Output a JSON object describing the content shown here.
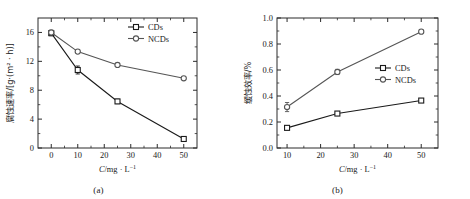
{
  "figure": {
    "background_color": "#ffffff",
    "panel_count": 2
  },
  "chart_data": [
    {
      "type": "line",
      "panel_label": "(a)",
      "title": "",
      "xlabel": "C/mg · L⁻¹",
      "ylabel": "腐蚀速率/[g·(m² · h)]",
      "xlim": [
        -5,
        55
      ],
      "ylim": [
        0,
        18
      ],
      "xticks": [
        0,
        10,
        20,
        30,
        40,
        50
      ],
      "xtick_labels": [
        "0",
        "10",
        "20",
        "30",
        "40",
        "50"
      ],
      "yticks": [
        0,
        4,
        8,
        12,
        16
      ],
      "ytick_labels": [
        "0",
        "4",
        "8",
        "12",
        "16"
      ],
      "minor_x_ticks": [
        5,
        15,
        25,
        35,
        45
      ],
      "minor_y_ticks": [
        2,
        6,
        10,
        14
      ],
      "grid": false,
      "legend_position": "top-right",
      "x": [
        0,
        10,
        25,
        50
      ],
      "series": [
        {
          "name": "CDs",
          "color": "#1a1a1a",
          "marker": "square-open",
          "values": [
            15.9,
            10.8,
            6.45,
            1.25
          ],
          "errors": [
            0.35,
            0.55,
            0.3,
            0.2
          ]
        },
        {
          "name": "NCDs",
          "color": "#555555",
          "marker": "circle-open",
          "values": [
            16.0,
            13.35,
            11.5,
            9.65
          ],
          "errors": [
            0.3,
            0.2,
            0.2,
            0.2
          ]
        }
      ]
    },
    {
      "type": "line",
      "panel_label": "(b)",
      "title": "",
      "xlabel": "C/mg · L⁻¹",
      "ylabel": "缓蚀效率/%",
      "xlim": [
        7,
        55
      ],
      "ylim": [
        0.0,
        1.0
      ],
      "xticks": [
        10,
        20,
        30,
        40,
        50
      ],
      "xtick_labels": [
        "10",
        "20",
        "30",
        "40",
        "50"
      ],
      "yticks": [
        0.0,
        0.2,
        0.4,
        0.6,
        0.8,
        1.0
      ],
      "ytick_labels": [
        "0.0",
        "0.2",
        "0.4",
        "0.6",
        "0.8",
        "1.0"
      ],
      "minor_x_ticks": [
        15,
        25,
        35,
        45
      ],
      "minor_y_ticks": [
        0.1,
        0.3,
        0.5,
        0.7,
        0.9
      ],
      "grid": false,
      "legend_position": "middle-right",
      "x": [
        10,
        25,
        50
      ],
      "series": [
        {
          "name": "CDs",
          "color": "#1a1a1a",
          "marker": "square-open",
          "values": [
            0.155,
            0.265,
            0.365
          ],
          "errors": [
            0.012,
            0.012,
            0.012
          ]
        },
        {
          "name": "NCDs",
          "color": "#555555",
          "marker": "circle-open",
          "values": [
            0.315,
            0.585,
            0.895
          ],
          "errors": [
            0.035,
            0.02,
            0.012
          ]
        }
      ]
    }
  ]
}
